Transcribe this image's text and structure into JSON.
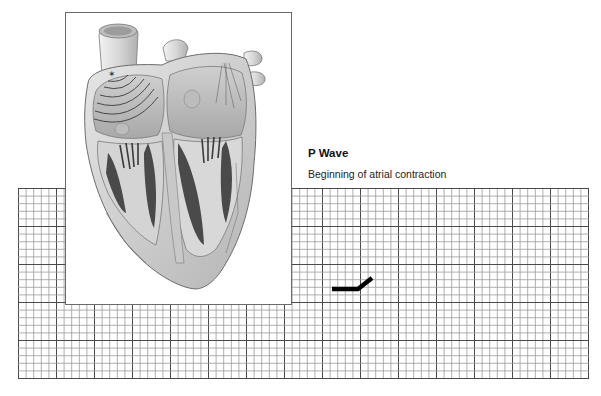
{
  "label": {
    "title": "P Wave",
    "subtitle": "Beginning of atrial contraction"
  },
  "illustration": {
    "subject": "heart-cross-section",
    "description": "Cross-section of the heart with conduction waves spreading from the SA node across the atria"
  },
  "ecg_grid": {
    "small_cell_px": 7.6,
    "major_every": 5,
    "minor_color": "#9a9a9a",
    "major_color": "#4a4a4a"
  },
  "ecg_trace": {
    "segment": "P wave onset",
    "color": "#000000",
    "points": [
      [
        332,
        289
      ],
      [
        358,
        289
      ],
      [
        372,
        278
      ]
    ]
  },
  "caption": {
    "text": ""
  }
}
